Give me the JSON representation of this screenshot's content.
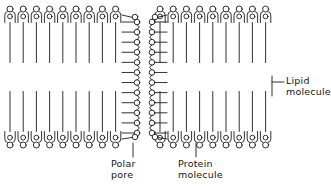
{
  "diagram": {
    "type": "lipid-bilayer-with-protein-pore",
    "stroke_color": "#1a1a1a",
    "fill_color": "#ffffff",
    "background_color": "#ffffff",
    "labels": {
      "lipid": {
        "line1": "Lipid",
        "line2": "molecule"
      },
      "polar_pore": {
        "line1": "Polar",
        "line2": "pore"
      },
      "protein": {
        "line1": "Protein",
        "line2": "molecule"
      }
    },
    "structure": {
      "lipid_head_outer_radius": 3.0,
      "lipid_head_inner_radius": 2.4,
      "lipid_tail_length": 40,
      "lipid_spacing": 13.2,
      "upper_leaflet_top_y": 6,
      "lower_leaflet_bottom_y": 148,
      "left_group_count": 9,
      "right_group_count": 9,
      "protein_bead_radius": 2.8,
      "protein_bead_rows": 12,
      "pore_left_x": 137,
      "pore_right_x": 152,
      "pore_width": 15
    }
  }
}
